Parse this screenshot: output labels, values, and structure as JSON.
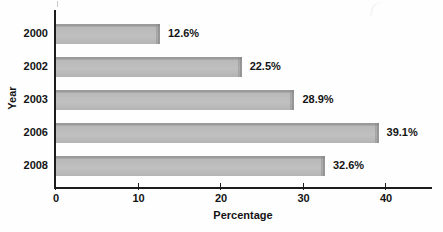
{
  "chart_data": {
    "type": "bar",
    "orientation": "horizontal",
    "title": "",
    "xlabel": "Percentage",
    "ylabel": "Year",
    "categories": [
      "2000",
      "2002",
      "2003",
      "2006",
      "2008"
    ],
    "values": [
      12.6,
      22.5,
      28.9,
      39.1,
      32.6
    ],
    "data_labels": [
      "12.6%",
      "22.5%",
      "28.9%",
      "39.1%",
      "32.6%"
    ],
    "xlim": [
      0,
      45.8
    ],
    "xticks": [
      0,
      10,
      20,
      30,
      40
    ],
    "xtick_labels": [
      "0",
      "10",
      "20",
      "30",
      "40"
    ],
    "grid": false,
    "legend": null,
    "bar_color": "#bdbdbd",
    "axis_color": "#1c1c1c",
    "text_color": "#141414"
  },
  "artifacts": {
    "top_remnant_text": ""
  }
}
